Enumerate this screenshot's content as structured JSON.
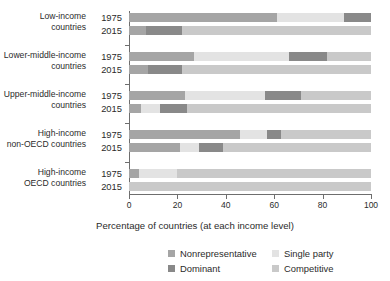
{
  "chart_data": {
    "type": "bar",
    "orientation": "horizontal",
    "stacked": true,
    "stack_total": 100,
    "title": "",
    "xlabel": "Percentage of countries (at each income level)",
    "ylabel": "",
    "xlim": [
      0,
      100
    ],
    "xticks": [
      0,
      20,
      40,
      60,
      80,
      100
    ],
    "xtick_labels": [
      "0",
      "20",
      "40",
      "60",
      "80",
      "100"
    ],
    "grid": false,
    "legend_position": "bottom",
    "series": [
      {
        "name": "Nonrepresentative",
        "color": "#a5a5a5"
      },
      {
        "name": "Single party",
        "color": "#e3e3e3"
      },
      {
        "name": "Dominant",
        "color": "#898989"
      },
      {
        "name": "Competitive",
        "color": "#c9c9c9"
      }
    ],
    "groups": [
      {
        "category": "Low-income countries",
        "category_line1": "Low-income",
        "category_line2": "countries",
        "rows": [
          {
            "year": "1975",
            "values": {
              "Nonrepresentative": 61,
              "Single party": 28,
              "Dominant": 11,
              "Competitive": 0
            }
          },
          {
            "year": "2015",
            "values": {
              "Nonrepresentative": 7,
              "Single party": 0,
              "Dominant": 15,
              "Competitive": 78
            }
          }
        ]
      },
      {
        "category": "Lower-middle-income countries",
        "category_line1": "Lower-middle-income",
        "category_line2": "countries",
        "rows": [
          {
            "year": "1975",
            "values": {
              "Nonrepresentative": 27,
              "Single party": 39,
              "Dominant": 16,
              "Competitive": 18
            }
          },
          {
            "year": "2015",
            "values": {
              "Nonrepresentative": 8,
              "Single party": 0,
              "Dominant": 14,
              "Competitive": 78
            }
          }
        ]
      },
      {
        "category": "Upper-middle-income countries",
        "category_line1": "Upper-middle-income",
        "category_line2": "countries",
        "rows": [
          {
            "year": "1975",
            "values": {
              "Nonrepresentative": 23,
              "Single party": 33,
              "Dominant": 15,
              "Competitive": 29
            }
          },
          {
            "year": "2015",
            "values": {
              "Nonrepresentative": 5,
              "Single party": 8,
              "Dominant": 11,
              "Competitive": 76
            }
          }
        ]
      },
      {
        "category": "High-income non-OECD countries",
        "category_line1": "High-income",
        "category_line2": "non-OECD countries",
        "rows": [
          {
            "year": "1975",
            "values": {
              "Nonrepresentative": 46,
              "Single party": 11,
              "Dominant": 6,
              "Competitive": 37
            }
          },
          {
            "year": "2015",
            "values": {
              "Nonrepresentative": 21,
              "Single party": 8,
              "Dominant": 10,
              "Competitive": 61
            }
          }
        ]
      },
      {
        "category": "High-income OECD countries",
        "category_line1": "High-income",
        "category_line2": "OECD countries",
        "rows": [
          {
            "year": "1975",
            "values": {
              "Nonrepresentative": 4,
              "Single party": 16,
              "Dominant": 0,
              "Competitive": 80
            }
          },
          {
            "year": "2015",
            "values": {
              "Nonrepresentative": 0,
              "Single party": 0,
              "Dominant": 0,
              "Competitive": 100
            }
          }
        ]
      }
    ],
    "legend": [
      {
        "label": "Nonrepresentative",
        "color": "#a5a5a5"
      },
      {
        "label": "Single party",
        "color": "#e3e3e3"
      },
      {
        "label": "Dominant",
        "color": "#898989"
      },
      {
        "label": "Competitive",
        "color": "#c9c9c9"
      }
    ]
  }
}
